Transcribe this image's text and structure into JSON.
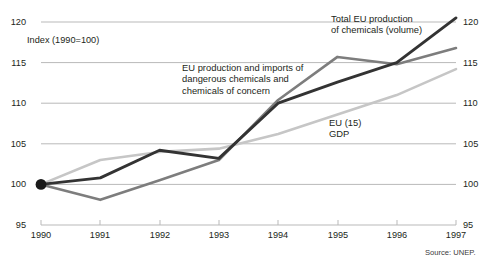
{
  "chart_data": {
    "type": "line",
    "title": "",
    "subtitle": "",
    "xlabel": "",
    "ylabel": "Index (1990=100)",
    "x": [
      1990,
      1991,
      1992,
      1993,
      1994,
      1995,
      1996,
      1997
    ],
    "categories": [
      "1990",
      "1991",
      "1992",
      "1993",
      "1994",
      "1995",
      "1996",
      "1997"
    ],
    "xlim": [
      1990,
      1997
    ],
    "ylim": [
      95,
      120
    ],
    "yticks": [
      95,
      100,
      105,
      110,
      115,
      120
    ],
    "ytick_labels_left": [
      "95",
      "100",
      "105",
      "110",
      "115",
      "120"
    ],
    "ytick_labels_right": [
      "95",
      "100",
      "105",
      "110",
      "115",
      "120"
    ],
    "grid": true,
    "legend": "inline-annotations",
    "series": [
      {
        "name": "Total EU production of chemicals (volume)",
        "color": "#333333",
        "values": [
          100.0,
          100.8,
          104.2,
          103.2,
          110.0,
          112.6,
          115.0,
          120.5
        ]
      },
      {
        "name": "EU production and imports of dangerous chemicals and chemicals of concern",
        "color": "#7d7d7d",
        "values": [
          100.0,
          98.1,
          100.5,
          103.0,
          110.4,
          115.7,
          114.8,
          116.8
        ]
      },
      {
        "name": "EU (15) GDP",
        "color": "#c6c6c6",
        "values": [
          100.0,
          103.0,
          104.0,
          104.4,
          106.2,
          108.6,
          111.0,
          114.2
        ]
      }
    ],
    "origin_marker": {
      "name": "origin-dot",
      "x": 1990,
      "y": 100,
      "color": "#1a1a1a"
    },
    "annotations": [
      {
        "name": "total-eu-production",
        "lines": [
          "Total EU production",
          "of chemicals (volume)"
        ]
      },
      {
        "name": "dangerous-chemicals",
        "lines": [
          "EU production and imports of",
          "dangerous chemicals and",
          "chemicals of concern"
        ]
      },
      {
        "name": "eu15-gdp",
        "lines": [
          "EU (15)",
          "GDP"
        ]
      }
    ],
    "axis_note": "Index (1990=100)",
    "source": "Source: UNEP."
  },
  "labels": {
    "index_note": "Index (1990=100)",
    "source": "Source: UNEP.",
    "annot_total_l1": "Total EU production",
    "annot_total_l2": "of chemicals (volume)",
    "annot_dang_l1": "EU production and imports of",
    "annot_dang_l2": "dangerous chemicals and",
    "annot_dang_l3": "chemicals of concern",
    "annot_gdp_l1": "EU (15)",
    "annot_gdp_l2": "GDP"
  },
  "yticks": {
    "t120": "120",
    "t115": "115",
    "t110": "110",
    "t105": "105",
    "t100": "100",
    "t95": "95"
  },
  "xticks": {
    "x1990": "1990",
    "x1991": "1991",
    "x1992": "1992",
    "x1993": "1993",
    "x1994": "1994",
    "x1995": "1995",
    "x1996": "1996",
    "x1997": "1997"
  },
  "colors": {
    "grid": "#b9b9b9",
    "series_dark": "#333333",
    "series_mid": "#7d7d7d",
    "series_light": "#c6c6c6",
    "text": "#231f20",
    "background": "#ffffff"
  }
}
